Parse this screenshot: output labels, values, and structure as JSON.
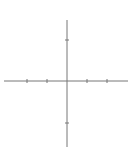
{
  "diagram": {
    "type": "elliptic-curve-plot",
    "equation_shape": "y^2 = x^3 - 3x + 1",
    "curve_color": "#d9463e",
    "axis_color": "#666666",
    "x_axis_label": "x",
    "y_axis_label": "y",
    "x_ticks": [
      {
        "value": -2,
        "label": "−2"
      },
      {
        "value": -1,
        "label": "−1"
      },
      {
        "value": 1,
        "label": "1"
      },
      {
        "value": 2,
        "label": "2"
      }
    ],
    "y_ticks": [
      {
        "value": 2,
        "label": "2"
      },
      {
        "value": -2,
        "label": "−2"
      }
    ],
    "x_range": [
      -3.2,
      3.5
    ],
    "y_range": [
      -3.2,
      3.8
    ]
  },
  "chart_data": {
    "type": "line",
    "title": "",
    "xlabel": "x",
    "ylabel": "y",
    "xlim": [
      -3.2,
      3.5
    ],
    "ylim": [
      -3.2,
      3.8
    ],
    "grid": false,
    "series": [
      {
        "name": "oval",
        "description": "closed bounded component of y^2 = x^3 - 3x + 1, x in [-1.88, 0.35]"
      },
      {
        "name": "unbounded-branch",
        "description": "unbounded component of y^2 = x^3 - 3x + 1, x >= 1.53"
      }
    ],
    "x_intercepts": [
      -1.88,
      0.35,
      1.53
    ]
  }
}
